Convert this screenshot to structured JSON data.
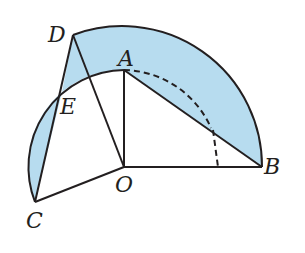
{
  "diagram": {
    "type": "geometry",
    "fill_color": "#b7dcef",
    "stroke_color": "#231f20",
    "points": {
      "O": {
        "label": "O",
        "x": 124,
        "y": 167
      },
      "A": {
        "label": "A",
        "x": 124,
        "y": 70
      },
      "B": {
        "label": "B",
        "x": 262,
        "y": 167
      },
      "C": {
        "label": "C",
        "x": 35,
        "y": 202
      },
      "D": {
        "label": "D",
        "x": 73,
        "y": 35
      },
      "E": {
        "label": "E",
        "x": 60,
        "y": 94
      }
    },
    "segments": [
      "OA",
      "OB",
      "OC",
      "OD",
      "AB",
      "CD"
    ],
    "arcs": [
      {
        "name": "large-arc-DB",
        "center": "O",
        "radius": 138,
        "style": "solid"
      },
      {
        "name": "small-arc-CEA",
        "center": "O",
        "radius": 97,
        "style": "solid"
      },
      {
        "name": "small-arc-A-to-OB",
        "center": "O",
        "radius": 97,
        "style": "dashed"
      }
    ]
  }
}
